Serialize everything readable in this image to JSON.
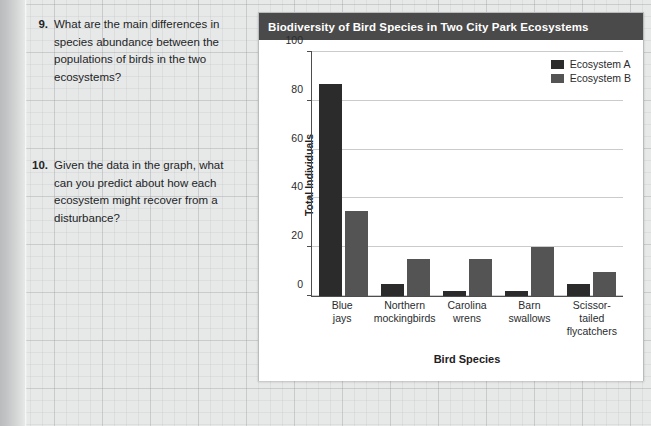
{
  "questions": [
    {
      "number": "9.",
      "text": "What are the main differences in species abundance between the populations of birds in the two ecosystems?"
    },
    {
      "number": "10.",
      "text": "Given the data in the graph, what can you predict about how each ecosystem might recover from a disturbance?"
    }
  ],
  "chart_card": {
    "title": "Biodiversity of Bird Species in Two City Park Ecosystems"
  },
  "colors": {
    "series_a": "#2b2b2b",
    "series_b": "#545454",
    "title_bar": "#4a4a4a",
    "gridline": "#c9cccd",
    "axis": "#4d4d4d",
    "page_background": "#e9eaea"
  },
  "chart_data": {
    "type": "bar",
    "title": "Biodiversity of Bird Species in Two City Park Ecosystems",
    "xlabel": "Bird Species",
    "ylabel": "Total Individuals",
    "categories": [
      "Blue jays",
      "Northern mockingbirds",
      "Carolina wrens",
      "Barn swallows",
      "Scissor-tailed flycatchers"
    ],
    "category_lines": [
      [
        "Blue",
        "jays"
      ],
      [
        "Northern",
        "mockingbirds"
      ],
      [
        "Carolina",
        "wrens"
      ],
      [
        "Barn",
        "swallows"
      ],
      [
        "Scissor-",
        "tailed",
        "flycatchers"
      ]
    ],
    "series": [
      {
        "name": "Ecosystem A",
        "values": [
          87,
          5,
          2,
          2,
          5
        ],
        "color": "#2b2b2b"
      },
      {
        "name": "Ecosystem B",
        "values": [
          35,
          15,
          15,
          20,
          10
        ],
        "color": "#545454"
      }
    ],
    "ylim": [
      0,
      100
    ],
    "yticks": [
      0,
      20,
      40,
      60,
      80,
      100
    ],
    "ytick_labels": [
      "0",
      "20",
      "40",
      "60",
      "80",
      "100"
    ],
    "grid": true,
    "legend_position": "top-right"
  }
}
